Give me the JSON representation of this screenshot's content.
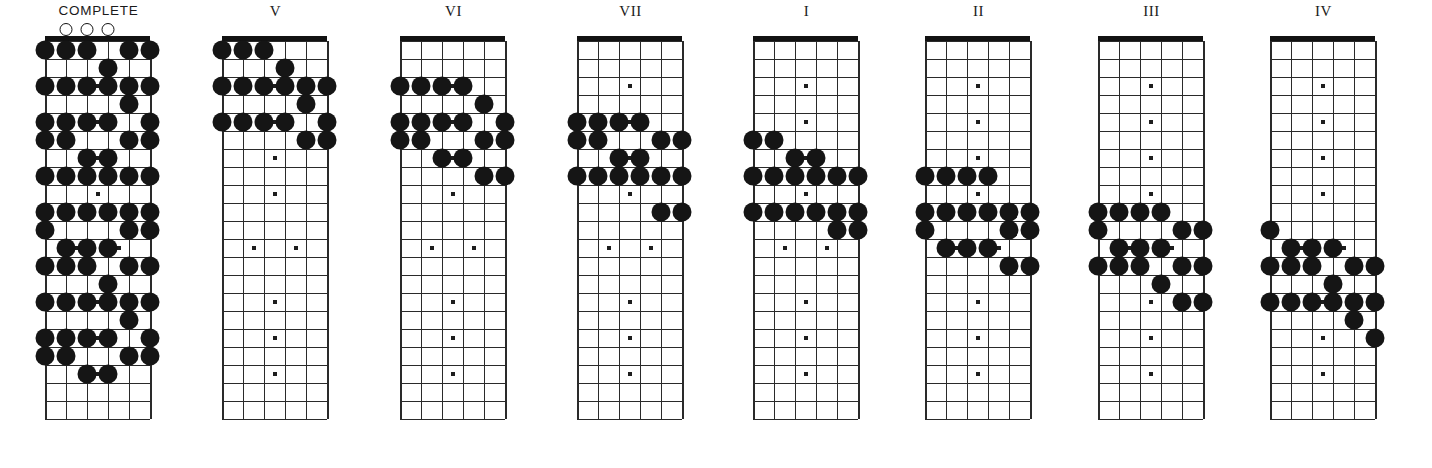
{
  "page": {
    "background_color": "#ffffff",
    "note_color": "#151515",
    "line_color": "#2a2a2a",
    "nut_color": "#121212"
  },
  "layout": {
    "string_count": 6,
    "fret_count": 21,
    "string_spacing_px": 21,
    "fret_spacing_px": 18,
    "note_radius_px": 9.5,
    "small_marker_px": 4
  },
  "diagrams": [
    {
      "id": "complete",
      "label": "COMPLETE",
      "label_style": "sans",
      "x": 45,
      "open_strings": [
        2,
        3,
        4
      ],
      "notes": [
        {
          "s": 1,
          "f": 1
        },
        {
          "s": 2,
          "f": 1
        },
        {
          "s": 3,
          "f": 1
        },
        {
          "s": 5,
          "f": 1
        },
        {
          "s": 6,
          "f": 1
        },
        {
          "s": 4,
          "f": 2
        },
        {
          "s": 1,
          "f": 3
        },
        {
          "s": 2,
          "f": 3
        },
        {
          "s": 3,
          "f": 3
        },
        {
          "s": 4,
          "f": 3
        },
        {
          "s": 5,
          "f": 3
        },
        {
          "s": 6,
          "f": 3
        },
        {
          "s": 5,
          "f": 4
        },
        {
          "s": 1,
          "f": 5
        },
        {
          "s": 2,
          "f": 5
        },
        {
          "s": 3,
          "f": 5
        },
        {
          "s": 4,
          "f": 5
        },
        {
          "s": 6,
          "f": 5
        },
        {
          "s": 1,
          "f": 6
        },
        {
          "s": 2,
          "f": 6
        },
        {
          "s": 5,
          "f": 6
        },
        {
          "s": 6,
          "f": 6
        },
        {
          "s": 3,
          "f": 7
        },
        {
          "s": 4,
          "f": 7
        },
        {
          "s": 1,
          "f": 8
        },
        {
          "s": 2,
          "f": 8
        },
        {
          "s": 3,
          "f": 8
        },
        {
          "s": 4,
          "f": 8
        },
        {
          "s": 5,
          "f": 8
        },
        {
          "s": 6,
          "f": 8
        },
        {
          "s": 1,
          "f": 10
        },
        {
          "s": 2,
          "f": 10
        },
        {
          "s": 3,
          "f": 10
        },
        {
          "s": 4,
          "f": 10
        },
        {
          "s": 5,
          "f": 10
        },
        {
          "s": 6,
          "f": 10
        },
        {
          "s": 1,
          "f": 11
        },
        {
          "s": 5,
          "f": 11
        },
        {
          "s": 6,
          "f": 11
        },
        {
          "s": 2,
          "f": 12
        },
        {
          "s": 3,
          "f": 12
        },
        {
          "s": 4,
          "f": 12
        },
        {
          "s": 1,
          "f": 13
        },
        {
          "s": 2,
          "f": 13
        },
        {
          "s": 3,
          "f": 13
        },
        {
          "s": 5,
          "f": 13
        },
        {
          "s": 6,
          "f": 13
        },
        {
          "s": 4,
          "f": 14
        },
        {
          "s": 1,
          "f": 15
        },
        {
          "s": 2,
          "f": 15
        },
        {
          "s": 3,
          "f": 15
        },
        {
          "s": 4,
          "f": 15
        },
        {
          "s": 5,
          "f": 15
        },
        {
          "s": 6,
          "f": 15
        },
        {
          "s": 5,
          "f": 16
        },
        {
          "s": 1,
          "f": 17
        },
        {
          "s": 2,
          "f": 17
        },
        {
          "s": 3,
          "f": 17
        },
        {
          "s": 4,
          "f": 17
        },
        {
          "s": 6,
          "f": 17
        },
        {
          "s": 1,
          "f": 18
        },
        {
          "s": 2,
          "f": 18
        },
        {
          "s": 5,
          "f": 18
        },
        {
          "s": 6,
          "f": 18
        },
        {
          "s": 3,
          "f": 19
        },
        {
          "s": 4,
          "f": 19
        }
      ],
      "inlays": [
        {
          "f": 3,
          "pos": 3.5
        },
        {
          "f": 5,
          "pos": 3.5
        },
        {
          "f": 7,
          "pos": 3.5
        },
        {
          "f": 9,
          "pos": 3.5
        },
        {
          "f": 12,
          "pos": 2.5
        },
        {
          "f": 12,
          "pos": 4.5
        },
        {
          "f": 15,
          "pos": 3.5
        },
        {
          "f": 17,
          "pos": 3.5
        },
        {
          "f": 19,
          "pos": 3.5
        }
      ]
    },
    {
      "id": "pattern-v",
      "label": "V",
      "label_style": "serif",
      "x": 222,
      "open_strings": [],
      "notes": [
        {
          "s": 1,
          "f": 1
        },
        {
          "s": 2,
          "f": 1
        },
        {
          "s": 3,
          "f": 1
        },
        {
          "s": 4,
          "f": 2
        },
        {
          "s": 1,
          "f": 3
        },
        {
          "s": 2,
          "f": 3
        },
        {
          "s": 3,
          "f": 3
        },
        {
          "s": 4,
          "f": 3
        },
        {
          "s": 5,
          "f": 3
        },
        {
          "s": 6,
          "f": 3
        },
        {
          "s": 5,
          "f": 4
        },
        {
          "s": 1,
          "f": 5
        },
        {
          "s": 2,
          "f": 5
        },
        {
          "s": 3,
          "f": 5
        },
        {
          "s": 4,
          "f": 5
        },
        {
          "s": 6,
          "f": 5
        },
        {
          "s": 5,
          "f": 6
        },
        {
          "s": 6,
          "f": 6
        }
      ],
      "inlays": [
        {
          "f": 3,
          "pos": 3.5
        },
        {
          "f": 5,
          "pos": 3.5
        },
        {
          "f": 7,
          "pos": 3.5
        },
        {
          "f": 9,
          "pos": 3.5
        },
        {
          "f": 12,
          "pos": 2.5
        },
        {
          "f": 12,
          "pos": 4.5
        },
        {
          "f": 15,
          "pos": 3.5
        },
        {
          "f": 17,
          "pos": 3.5
        },
        {
          "f": 19,
          "pos": 3.5
        }
      ]
    },
    {
      "id": "pattern-vi",
      "label": "VI",
      "label_style": "serif",
      "x": 400,
      "open_strings": [],
      "notes": [
        {
          "s": 1,
          "f": 3
        },
        {
          "s": 2,
          "f": 3
        },
        {
          "s": 3,
          "f": 3
        },
        {
          "s": 4,
          "f": 3
        },
        {
          "s": 5,
          "f": 4
        },
        {
          "s": 1,
          "f": 5
        },
        {
          "s": 2,
          "f": 5
        },
        {
          "s": 3,
          "f": 5
        },
        {
          "s": 4,
          "f": 5
        },
        {
          "s": 6,
          "f": 5
        },
        {
          "s": 1,
          "f": 6
        },
        {
          "s": 2,
          "f": 6
        },
        {
          "s": 5,
          "f": 6
        },
        {
          "s": 6,
          "f": 6
        },
        {
          "s": 3,
          "f": 7
        },
        {
          "s": 4,
          "f": 7
        },
        {
          "s": 5,
          "f": 8
        },
        {
          "s": 6,
          "f": 8
        }
      ],
      "inlays": [
        {
          "f": 3,
          "pos": 3.5
        },
        {
          "f": 5,
          "pos": 3.5
        },
        {
          "f": 7,
          "pos": 3.5
        },
        {
          "f": 9,
          "pos": 3.5
        },
        {
          "f": 12,
          "pos": 2.5
        },
        {
          "f": 12,
          "pos": 4.5
        },
        {
          "f": 15,
          "pos": 3.5
        },
        {
          "f": 17,
          "pos": 3.5
        },
        {
          "f": 19,
          "pos": 3.5
        }
      ]
    },
    {
      "id": "pattern-vii",
      "label": "VII",
      "label_style": "serif",
      "x": 577,
      "open_strings": [],
      "notes": [
        {
          "s": 1,
          "f": 5
        },
        {
          "s": 2,
          "f": 5
        },
        {
          "s": 3,
          "f": 5
        },
        {
          "s": 4,
          "f": 5
        },
        {
          "s": 1,
          "f": 6
        },
        {
          "s": 2,
          "f": 6
        },
        {
          "s": 5,
          "f": 6
        },
        {
          "s": 6,
          "f": 6
        },
        {
          "s": 3,
          "f": 7
        },
        {
          "s": 4,
          "f": 7
        },
        {
          "s": 1,
          "f": 8
        },
        {
          "s": 2,
          "f": 8
        },
        {
          "s": 3,
          "f": 8
        },
        {
          "s": 4,
          "f": 8
        },
        {
          "s": 5,
          "f": 8
        },
        {
          "s": 6,
          "f": 8
        },
        {
          "s": 5,
          "f": 10
        },
        {
          "s": 6,
          "f": 10
        }
      ],
      "inlays": [
        {
          "f": 3,
          "pos": 3.5
        },
        {
          "f": 5,
          "pos": 3.5
        },
        {
          "f": 7,
          "pos": 3.5
        },
        {
          "f": 9,
          "pos": 3.5
        },
        {
          "f": 12,
          "pos": 2.5
        },
        {
          "f": 12,
          "pos": 4.5
        },
        {
          "f": 15,
          "pos": 3.5
        },
        {
          "f": 17,
          "pos": 3.5
        },
        {
          "f": 19,
          "pos": 3.5
        }
      ]
    },
    {
      "id": "pattern-i",
      "label": "I",
      "label_style": "serif",
      "x": 753,
      "open_strings": [],
      "notes": [
        {
          "s": 1,
          "f": 6
        },
        {
          "s": 2,
          "f": 6
        },
        {
          "s": 3,
          "f": 7
        },
        {
          "s": 4,
          "f": 7
        },
        {
          "s": 1,
          "f": 8
        },
        {
          "s": 2,
          "f": 8
        },
        {
          "s": 3,
          "f": 8
        },
        {
          "s": 4,
          "f": 8
        },
        {
          "s": 5,
          "f": 8
        },
        {
          "s": 6,
          "f": 8
        },
        {
          "s": 1,
          "f": 10
        },
        {
          "s": 2,
          "f": 10
        },
        {
          "s": 3,
          "f": 10
        },
        {
          "s": 4,
          "f": 10
        },
        {
          "s": 5,
          "f": 10
        },
        {
          "s": 6,
          "f": 10
        },
        {
          "s": 5,
          "f": 11
        },
        {
          "s": 6,
          "f": 11
        }
      ],
      "inlays": [
        {
          "f": 3,
          "pos": 3.5
        },
        {
          "f": 5,
          "pos": 3.5
        },
        {
          "f": 7,
          "pos": 3.5
        },
        {
          "f": 9,
          "pos": 3.5
        },
        {
          "f": 12,
          "pos": 2.5
        },
        {
          "f": 12,
          "pos": 4.5
        },
        {
          "f": 15,
          "pos": 3.5
        },
        {
          "f": 17,
          "pos": 3.5
        },
        {
          "f": 19,
          "pos": 3.5
        }
      ]
    },
    {
      "id": "pattern-ii",
      "label": "II",
      "label_style": "serif",
      "x": 925,
      "open_strings": [],
      "notes": [
        {
          "s": 1,
          "f": 8
        },
        {
          "s": 2,
          "f": 8
        },
        {
          "s": 3,
          "f": 8
        },
        {
          "s": 4,
          "f": 8
        },
        {
          "s": 1,
          "f": 10
        },
        {
          "s": 2,
          "f": 10
        },
        {
          "s": 3,
          "f": 10
        },
        {
          "s": 4,
          "f": 10
        },
        {
          "s": 5,
          "f": 10
        },
        {
          "s": 6,
          "f": 10
        },
        {
          "s": 1,
          "f": 11
        },
        {
          "s": 5,
          "f": 11
        },
        {
          "s": 6,
          "f": 11
        },
        {
          "s": 2,
          "f": 12
        },
        {
          "s": 3,
          "f": 12
        },
        {
          "s": 4,
          "f": 12
        },
        {
          "s": 5,
          "f": 13
        },
        {
          "s": 6,
          "f": 13
        }
      ],
      "inlays": [
        {
          "f": 3,
          "pos": 3.5
        },
        {
          "f": 5,
          "pos": 3.5
        },
        {
          "f": 7,
          "pos": 3.5
        },
        {
          "f": 9,
          "pos": 3.5
        },
        {
          "f": 12,
          "pos": 2.5
        },
        {
          "f": 12,
          "pos": 4.5
        },
        {
          "f": 15,
          "pos": 3.5
        },
        {
          "f": 17,
          "pos": 3.5
        },
        {
          "f": 19,
          "pos": 3.5
        }
      ]
    },
    {
      "id": "pattern-iii",
      "label": "III",
      "label_style": "serif",
      "x": 1098,
      "open_strings": [],
      "notes": [
        {
          "s": 1,
          "f": 10
        },
        {
          "s": 2,
          "f": 10
        },
        {
          "s": 3,
          "f": 10
        },
        {
          "s": 4,
          "f": 10
        },
        {
          "s": 1,
          "f": 11
        },
        {
          "s": 5,
          "f": 11
        },
        {
          "s": 6,
          "f": 11
        },
        {
          "s": 2,
          "f": 12
        },
        {
          "s": 3,
          "f": 12
        },
        {
          "s": 4,
          "f": 12
        },
        {
          "s": 1,
          "f": 13
        },
        {
          "s": 2,
          "f": 13
        },
        {
          "s": 3,
          "f": 13
        },
        {
          "s": 5,
          "f": 13
        },
        {
          "s": 6,
          "f": 13
        },
        {
          "s": 4,
          "f": 14
        },
        {
          "s": 5,
          "f": 15
        },
        {
          "s": 6,
          "f": 15
        }
      ],
      "inlays": [
        {
          "f": 3,
          "pos": 3.5
        },
        {
          "f": 5,
          "pos": 3.5
        },
        {
          "f": 7,
          "pos": 3.5
        },
        {
          "f": 9,
          "pos": 3.5
        },
        {
          "f": 12,
          "pos": 2.5
        },
        {
          "f": 12,
          "pos": 4.5
        },
        {
          "f": 15,
          "pos": 3.5
        },
        {
          "f": 17,
          "pos": 3.5
        },
        {
          "f": 19,
          "pos": 3.5
        }
      ]
    },
    {
      "id": "pattern-iv",
      "label": "IV",
      "label_style": "serif",
      "x": 1270,
      "open_strings": [],
      "notes": [
        {
          "s": 1,
          "f": 11
        },
        {
          "s": 2,
          "f": 12
        },
        {
          "s": 3,
          "f": 12
        },
        {
          "s": 4,
          "f": 12
        },
        {
          "s": 1,
          "f": 13
        },
        {
          "s": 2,
          "f": 13
        },
        {
          "s": 3,
          "f": 13
        },
        {
          "s": 5,
          "f": 13
        },
        {
          "s": 6,
          "f": 13
        },
        {
          "s": 4,
          "f": 14
        },
        {
          "s": 1,
          "f": 15
        },
        {
          "s": 2,
          "f": 15
        },
        {
          "s": 3,
          "f": 15
        },
        {
          "s": 4,
          "f": 15
        },
        {
          "s": 5,
          "f": 15
        },
        {
          "s": 6,
          "f": 15
        },
        {
          "s": 5,
          "f": 16
        },
        {
          "s": 6,
          "f": 17
        }
      ],
      "inlays": [
        {
          "f": 3,
          "pos": 3.5
        },
        {
          "f": 5,
          "pos": 3.5
        },
        {
          "f": 7,
          "pos": 3.5
        },
        {
          "f": 9,
          "pos": 3.5
        },
        {
          "f": 12,
          "pos": 2.5
        },
        {
          "f": 12,
          "pos": 4.5
        },
        {
          "f": 15,
          "pos": 3.5
        },
        {
          "f": 17,
          "pos": 3.5
        },
        {
          "f": 19,
          "pos": 3.5
        }
      ]
    }
  ]
}
